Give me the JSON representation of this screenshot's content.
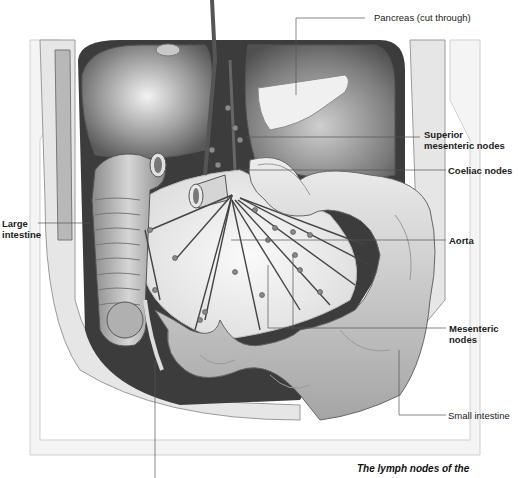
{
  "figure": {
    "caption": "The lymph nodes of the"
  },
  "labels": {
    "pancreas": "Pancreas (cut through)",
    "superior_mesenteric_l1": "Superior",
    "superior_mesenteric_l2": "mesenteric nodes",
    "coeliac": "Coeliac nodes",
    "aorta": "Aorta",
    "mesenteric_l1": "Mesenteric",
    "mesenteric_l2": "nodes",
    "small_intestine": "Small intestine",
    "large_intestine_l1": "Large",
    "large_intestine_l2": "intestine"
  },
  "colors": {
    "background": "#ffffff",
    "line": "#555555",
    "organ_light": "#d8d8d8",
    "organ_mid": "#a8a8a8",
    "organ_dark": "#4a4a4a",
    "text": "#222222"
  }
}
